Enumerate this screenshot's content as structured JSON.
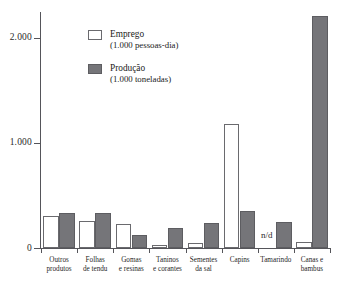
{
  "chart_data": {
    "type": "bar",
    "title": "",
    "subtitle": "",
    "xlabel": "",
    "ylabel": "",
    "ylim": [
      0,
      2300
    ],
    "grid": false,
    "legend_position": "inside-top-left",
    "yticks": [
      "0",
      "1.000",
      "2.000"
    ],
    "ytick_values": [
      0,
      1000,
      2000
    ],
    "categories": [
      "Outros\nprodutos",
      "Folhas\nde tendu",
      "Gomas\ne resinas",
      "Taninos\ne corantes",
      "Sementes\nda sal",
      "Capins",
      "Tamarindo",
      "Canas e\nbambus"
    ],
    "series": [
      {
        "name": "Emprego",
        "unit": "(1.000 pessoas-dia)",
        "color": "#ffffff",
        "values": [
          305,
          255,
          230,
          25,
          50,
          1185,
          null,
          55
        ]
      },
      {
        "name": "Produção",
        "unit": "(1.000 toneladas)",
        "color": "#757579",
        "values": [
          335,
          330,
          125,
          190,
          240,
          350,
          245,
          2210
        ]
      }
    ],
    "annotations": [
      {
        "text": "n/d",
        "category": "Tamarindo",
        "series": "Emprego"
      }
    ]
  },
  "legend": {
    "items": [
      {
        "name": "Emprego",
        "unit": "(1.000 pessoas-dia)"
      },
      {
        "name": "Produção",
        "unit": "(1.000 toneladas)"
      }
    ]
  }
}
